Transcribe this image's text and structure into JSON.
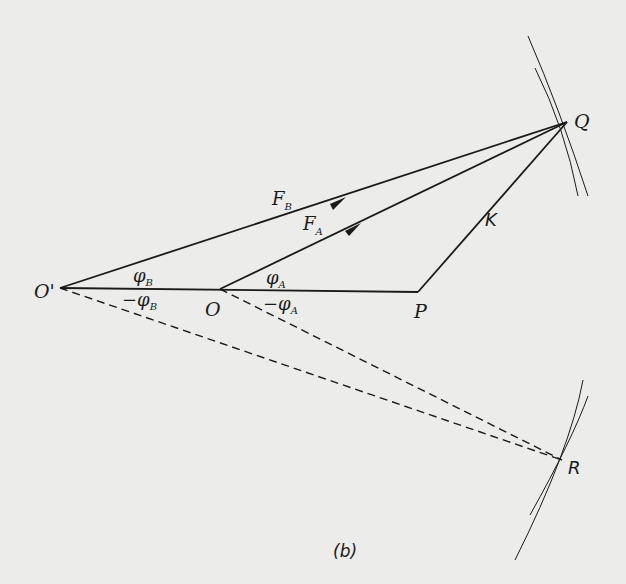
{
  "figure": {
    "caption": "(b)",
    "points": {
      "O_prime": {
        "label": "O'",
        "x": 60,
        "y": 288
      },
      "O": {
        "label": "O",
        "x": 220,
        "y": 289
      },
      "P": {
        "label": "P",
        "x": 418,
        "y": 292
      },
      "Q": {
        "label": "Q",
        "x": 567,
        "y": 122
      },
      "R": {
        "label": "R",
        "x": 562,
        "y": 460
      }
    },
    "vectors": [
      {
        "name": "F_B",
        "label": "F",
        "subscript": "B",
        "from": "O_prime",
        "to": "Q"
      },
      {
        "name": "F_A",
        "label": "F",
        "subscript": "A",
        "from": "O",
        "to": "Q"
      }
    ],
    "segments": [
      {
        "name": "K",
        "label": "K",
        "from": "P",
        "to": "Q"
      },
      {
        "name": "baseline",
        "from": "O_prime",
        "to": "P"
      }
    ],
    "dashed": [
      {
        "from": "O_prime",
        "to": "R"
      },
      {
        "from": "O",
        "to": "R"
      }
    ],
    "angles": {
      "phi_B": {
        "symbol": "φ",
        "subscript": "B"
      },
      "neg_phi_B": {
        "prefix": "−",
        "symbol": "φ",
        "subscript": "B"
      },
      "phi_A": {
        "symbol": "φ",
        "subscript": "A"
      },
      "neg_phi_A": {
        "prefix": "−",
        "symbol": "φ",
        "subscript": "A"
      }
    },
    "colors": {
      "ink": "#1a1a1a",
      "paper": "#ececea"
    }
  }
}
